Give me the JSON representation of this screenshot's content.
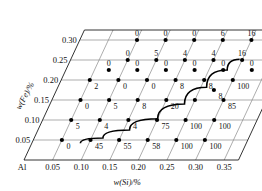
{
  "chart_data": {
    "type": "scatter",
    "title": "",
    "xlabel": "w(Si)/%",
    "ylabel": "w(Fe)/%",
    "origin_label": "Al",
    "xticks": [
      "0.05",
      "0.10",
      "0.15",
      "0.20",
      "0.25",
      "0.30",
      "0.35"
    ],
    "yticks": [
      "0.05",
      "0.10",
      "0.15",
      "0.20",
      "0.25",
      "0.30"
    ],
    "xlim": [
      0.0,
      0.375
    ],
    "ylim": [
      0.0,
      0.325
    ],
    "grid": true,
    "legend": "none",
    "projection": "sheared-parallelogram",
    "series": [
      {
        "name": "w(Fe)=0.30",
        "y": 0.3,
        "points": [
          {
            "x": 0.1,
            "label": "0"
          },
          {
            "x": 0.15,
            "label": "0"
          },
          {
            "x": 0.2,
            "label": "0"
          },
          {
            "x": 0.25,
            "label": "6"
          },
          {
            "x": 0.3,
            "label": "16"
          }
        ]
      },
      {
        "name": "w(Fe)=0.25",
        "y": 0.25,
        "points": [
          {
            "x": 0.1,
            "label": "0"
          },
          {
            "x": 0.15,
            "label": "5"
          },
          {
            "x": 0.2,
            "label": "4"
          },
          {
            "x": 0.25,
            "label": "4"
          },
          {
            "x": 0.3,
            "label": "16"
          },
          {
            "x": 0.35,
            "label": "12"
          }
        ]
      },
      {
        "name": "w(Fe)=0.225",
        "y": 0.225,
        "points": [
          {
            "x": 0.075,
            "label": "0"
          },
          {
            "x": 0.125,
            "label": "0"
          },
          {
            "x": 0.175,
            "label": "0"
          },
          {
            "x": 0.225,
            "label": "0"
          },
          {
            "x": 0.275,
            "label": "0"
          },
          {
            "x": 0.325,
            "label": "0"
          }
        ]
      },
      {
        "name": "w(Fe)=0.20",
        "y": 0.2,
        "points": [
          {
            "x": 0.05,
            "label": "2"
          },
          {
            "x": 0.1,
            "label": "0"
          },
          {
            "x": 0.15,
            "label": "0"
          },
          {
            "x": 0.2,
            "label": "8"
          },
          {
            "x": 0.25,
            "label": "8"
          },
          {
            "x": 0.3,
            "label": "100"
          }
        ]
      },
      {
        "name": "w(Fe)=0.175",
        "y": 0.175,
        "points": [
          {
            "x": 0.275,
            "label": "8"
          }
        ]
      },
      {
        "name": "w(Fe)=0.15",
        "y": 0.15,
        "points": [
          {
            "x": 0.05,
            "label": "0"
          },
          {
            "x": 0.1,
            "label": "5"
          },
          {
            "x": 0.15,
            "label": "8"
          },
          {
            "x": 0.2,
            "label": "20"
          },
          {
            "x": 0.25,
            "label": ""
          },
          {
            "x": 0.3,
            "label": "85"
          }
        ]
      },
      {
        "name": "w(Fe)=0.10",
        "y": 0.1,
        "points": [
          {
            "x": 0.05,
            "label": "5"
          },
          {
            "x": 0.1,
            "label": "4"
          },
          {
            "x": 0.15,
            "label": "4"
          },
          {
            "x": 0.2,
            "label": "75"
          },
          {
            "x": 0.25,
            "label": "100"
          },
          {
            "x": 0.3,
            "label": "100"
          }
        ]
      },
      {
        "name": "w(Fe)=0.05",
        "y": 0.05,
        "points": [
          {
            "x": 0.05,
            "label": "0"
          },
          {
            "x": 0.1,
            "label": "45"
          },
          {
            "x": 0.15,
            "label": "55"
          },
          {
            "x": 0.2,
            "label": "58"
          },
          {
            "x": 0.25,
            "label": "100"
          },
          {
            "x": 0.3,
            "label": "100"
          }
        ]
      }
    ],
    "boundary_curve": {
      "name": "phase-boundary",
      "description": "rising boundary curve",
      "points": [
        {
          "x": 0.085,
          "y": 0.042
        },
        {
          "x": 0.12,
          "y": 0.055
        },
        {
          "x": 0.16,
          "y": 0.075
        },
        {
          "x": 0.2,
          "y": 0.103
        },
        {
          "x": 0.235,
          "y": 0.14
        },
        {
          "x": 0.26,
          "y": 0.182
        },
        {
          "x": 0.282,
          "y": 0.225
        },
        {
          "x": 0.295,
          "y": 0.252
        }
      ]
    }
  }
}
